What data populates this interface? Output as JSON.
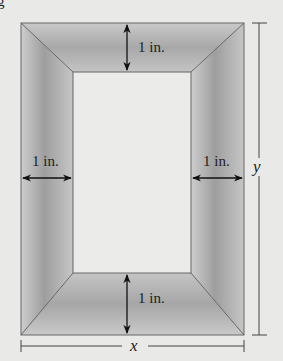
{
  "partial_heading_glyph": "g",
  "frame": {
    "top_label": "1 in.",
    "bottom_label": "1 in.",
    "left_label": "1 in.",
    "right_label": "1 in."
  },
  "dimensions": {
    "width_variable": "x",
    "height_variable": "y"
  },
  "colors": {
    "background": "#e9e9e7",
    "frame_dark": "#9a9a9a",
    "frame_light": "#cfcfcf",
    "inner": "#ebebea",
    "line": "#555555"
  }
}
